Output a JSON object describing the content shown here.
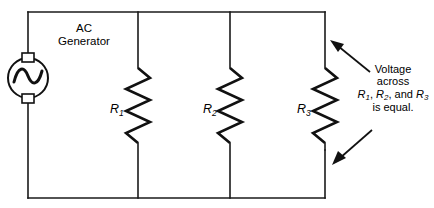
{
  "figure": {
    "type": "schematic",
    "top_caption_fragment": ""
  },
  "source": {
    "label_ac": "AC",
    "label_generator": "Generator",
    "symbol": "ac-generator-sine"
  },
  "resistors": [
    {
      "id": "R1",
      "base": "R",
      "sub": "1"
    },
    {
      "id": "R2",
      "base": "R",
      "sub": "2"
    },
    {
      "id": "R3",
      "base": "R",
      "sub": "3"
    }
  ],
  "annotation": {
    "line1": "Voltage",
    "line2": "across",
    "line3_prefix": "",
    "line3_r1": "R",
    "line3_r1_sub": "1",
    "line3_sep1": ", ",
    "line3_r2": "R",
    "line3_r2_sub": "2",
    "line3_sep2": ", and ",
    "line3_r3": "R",
    "line3_r3_sub": "3",
    "line4": "is equal."
  },
  "colors": {
    "ink": "#111111",
    "wire": "#1a1a1a",
    "background": "#ffffff"
  }
}
